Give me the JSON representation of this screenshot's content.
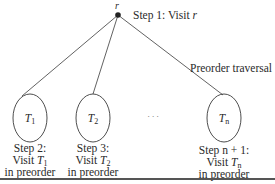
{
  "diagram": {
    "root": {
      "label": "r",
      "step_prefix": "Step 1: Visit ",
      "step_var": "r"
    },
    "annotation": "Preorder traversal",
    "ellipsis": ". . .",
    "subtrees": [
      {
        "name": "T",
        "sub": "1",
        "step_line1": "Step 2:",
        "visit": "Visit ",
        "var": "T",
        "var_sub": "1",
        "line3": "in preorder"
      },
      {
        "name": "T",
        "sub": "2",
        "step_line1": "Step 3:",
        "visit": "Visit ",
        "var": "T",
        "var_sub": "2",
        "line3": "in preorder"
      },
      {
        "name": "T",
        "sub": "n",
        "step_line1": "Step n + 1:",
        "visit": "Visit ",
        "var": "T",
        "var_sub": "n",
        "line3": "in preorder"
      }
    ],
    "colors": {
      "line": "#3a3a3a",
      "node": "#222222",
      "text": "#2a2a2a"
    }
  }
}
